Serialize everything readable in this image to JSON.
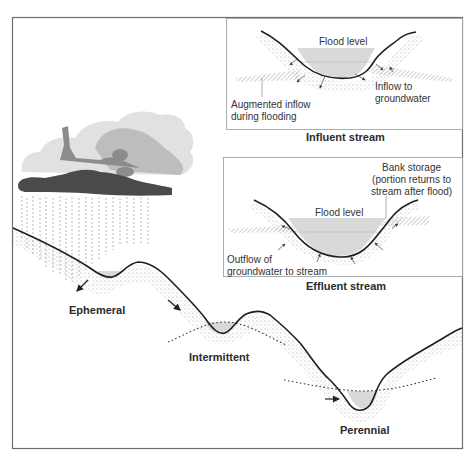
{
  "diagram": {
    "colors": {
      "frame": "#6e6e6e",
      "terrain_line": "#1e1e1e",
      "water_fill": "#d9d9d9",
      "cloud_dark": "#4a4a4a",
      "cloud_mid": "#8c8c8c",
      "cloud_light": "#bdbdbd",
      "cloud_pale": "#e1e1e1"
    },
    "insets": {
      "influent": {
        "caption": "Influent stream",
        "flood_label": "Flood level",
        "annotations": [
          {
            "id": "inflow",
            "text": "Inflow to\ngroundwater"
          },
          {
            "id": "augmented",
            "text": "Augmented inflow\nduring flooding"
          }
        ]
      },
      "effluent": {
        "caption": "Effluent stream",
        "flood_label": "Flood level",
        "annotations": [
          {
            "id": "bank",
            "text": "Bank storage\n(portion returns to\nstream after flood)"
          },
          {
            "id": "outflow",
            "text": "Outflow of\ngroundwater to stream"
          }
        ]
      }
    },
    "profile_labels": [
      {
        "id": "ephemeral",
        "text": "Ephemeral"
      },
      {
        "id": "intermittent",
        "text": "Intermittent"
      },
      {
        "id": "perennial",
        "text": "Perennial"
      }
    ]
  }
}
